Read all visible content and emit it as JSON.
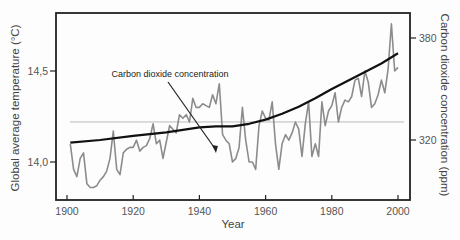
{
  "chart_data": {
    "type": "line",
    "title": "",
    "xlabel": "Year",
    "ylabel": "Global average temperature (°C)",
    "ylabel_right": "Carbon dioxide concentration (ppm)",
    "xlim": [
      1897,
      2004
    ],
    "ylim": [
      13.8,
      14.82
    ],
    "ylim_right": [
      304,
      402
    ],
    "x_ticks": [
      1900,
      1920,
      1940,
      1960,
      1980,
      2000
    ],
    "y_ticks": [
      {
        "value": 14.0,
        "label": "14,0"
      },
      {
        "value": 14.5,
        "label": "14,5"
      }
    ],
    "y_ticks_right": [
      {
        "value": 320,
        "label": "320"
      },
      {
        "value": 380,
        "label": "380"
      }
    ],
    "grid": false,
    "reference_line": {
      "axis": "left",
      "value": 14.22,
      "color": "#bbbbbb"
    },
    "annotations": [
      {
        "text": "Carbon dioxide concentration",
        "arrow_to": [
          1945,
          14.05
        ]
      }
    ],
    "series": [
      {
        "name": "Global average temperature",
        "axis": "left",
        "color": "#8c8c8c",
        "x": [
          1901,
          1902,
          1903,
          1904,
          1905,
          1906,
          1907,
          1908,
          1909,
          1910,
          1911,
          1912,
          1913,
          1914,
          1915,
          1916,
          1917,
          1918,
          1919,
          1920,
          1921,
          1922,
          1923,
          1924,
          1925,
          1926,
          1927,
          1928,
          1929,
          1930,
          1931,
          1932,
          1933,
          1934,
          1935,
          1936,
          1937,
          1938,
          1939,
          1940,
          1941,
          1942,
          1943,
          1944,
          1945,
          1946,
          1947,
          1948,
          1949,
          1950,
          1951,
          1952,
          1953,
          1954,
          1955,
          1956,
          1957,
          1958,
          1959,
          1960,
          1961,
          1962,
          1963,
          1964,
          1965,
          1966,
          1967,
          1968,
          1969,
          1970,
          1971,
          1972,
          1973,
          1974,
          1975,
          1976,
          1977,
          1978,
          1979,
          1980,
          1981,
          1982,
          1983,
          1984,
          1985,
          1986,
          1987,
          1988,
          1989,
          1990,
          1991,
          1992,
          1993,
          1994,
          1995,
          1996,
          1997,
          1998,
          1999,
          2000
        ],
        "values": [
          14.1,
          13.96,
          13.92,
          14.02,
          14.05,
          13.88,
          13.86,
          13.86,
          13.87,
          13.9,
          13.92,
          13.95,
          14.02,
          14.17,
          13.96,
          13.93,
          14.05,
          14.07,
          14.08,
          14.08,
          14.12,
          14.06,
          14.08,
          14.09,
          14.13,
          14.21,
          14.1,
          14.12,
          14.02,
          14.11,
          14.2,
          14.18,
          14.16,
          14.26,
          14.24,
          14.26,
          14.22,
          14.35,
          14.3,
          14.3,
          14.32,
          14.31,
          14.3,
          14.37,
          14.32,
          14.43,
          14.15,
          14.12,
          14.1,
          14.0,
          14.02,
          14.08,
          14.3,
          14.12,
          14.0,
          14.0,
          13.96,
          14.2,
          14.28,
          14.24,
          14.23,
          14.33,
          14.1,
          13.96,
          14.1,
          14.15,
          14.12,
          14.16,
          14.22,
          14.18,
          14.03,
          14.21,
          14.33,
          14.03,
          14.1,
          14.03,
          14.33,
          14.2,
          14.28,
          14.31,
          14.38,
          14.22,
          14.3,
          14.34,
          14.33,
          14.36,
          14.45,
          14.46,
          14.36,
          14.5,
          14.44,
          14.3,
          14.32,
          14.37,
          14.45,
          14.38,
          14.51,
          14.76,
          14.5,
          14.52
        ]
      },
      {
        "name": "Carbon dioxide concentration",
        "axis": "right",
        "color": "#111111",
        "x": [
          1901,
          1910,
          1920,
          1930,
          1940,
          1945,
          1950,
          1955,
          1960,
          1965,
          1970,
          1975,
          1980,
          1985,
          1990,
          1995,
          2000
        ],
        "values": [
          318.5,
          320,
          322.5,
          324.5,
          327.5,
          328,
          328,
          329.5,
          332,
          335.5,
          339.5,
          344.5,
          350,
          355,
          360,
          365,
          371
        ]
      }
    ]
  }
}
